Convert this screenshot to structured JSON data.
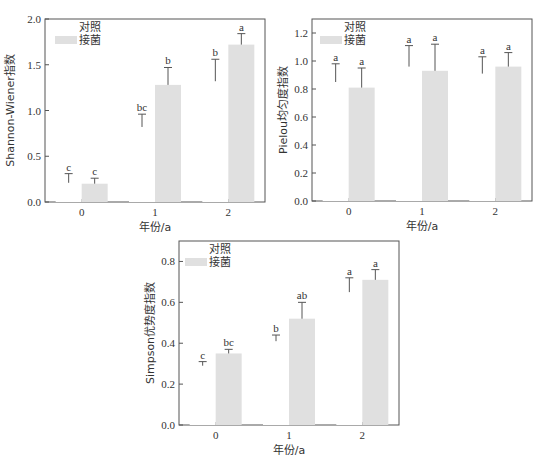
{
  "colors": {
    "treatment_bar": "#e0e0e0",
    "control_bar": "#ffffff",
    "axis": "#555555",
    "text": "#333333"
  },
  "legend": {
    "control": "对照",
    "treatment": "接菌"
  },
  "chart_data": [
    {
      "type": "bar",
      "title": "",
      "xlabel": "年份/a",
      "ylabel": "Shannon-Wiener指数",
      "ylim": [
        0,
        2.0
      ],
      "yticks": [
        0.0,
        0.5,
        1.0,
        1.5,
        2.0
      ],
      "ytick_labels": [
        "0.0",
        "0.5",
        "1.0",
        "1.5",
        "2.0"
      ],
      "categories": [
        "0",
        "1",
        "2"
      ],
      "legend_position": "upper left",
      "grid": false,
      "series": [
        {
          "name": "对照",
          "values": [
            0.21,
            0.82,
            1.32
          ],
          "error": [
            0.1,
            0.14,
            0.24
          ],
          "labels": [
            "c",
            "bc",
            "b"
          ]
        },
        {
          "name": "接菌",
          "values": [
            0.2,
            1.28,
            1.72
          ],
          "error": [
            0.06,
            0.19,
            0.12
          ],
          "labels": [
            "c",
            "b",
            "a"
          ]
        }
      ]
    },
    {
      "type": "bar",
      "title": "",
      "xlabel": "年份/a",
      "ylabel": "Pielou均匀度指数",
      "ylim": [
        0,
        1.3
      ],
      "yticks": [
        0.0,
        0.2,
        0.4,
        0.6,
        0.8,
        1.0,
        1.2
      ],
      "ytick_labels": [
        "0.0",
        "0.2",
        "0.4",
        "0.6",
        "0.8",
        "1.0",
        "1.2"
      ],
      "categories": [
        "0",
        "1",
        "2"
      ],
      "legend_position": "upper left",
      "grid": false,
      "series": [
        {
          "name": "对照",
          "values": [
            0.85,
            0.96,
            0.91
          ],
          "error": [
            0.13,
            0.15,
            0.12
          ],
          "labels": [
            "a",
            "a",
            "a"
          ]
        },
        {
          "name": "接菌",
          "values": [
            0.81,
            0.93,
            0.96
          ],
          "error": [
            0.14,
            0.19,
            0.1
          ],
          "labels": [
            "a",
            "a",
            "a"
          ]
        }
      ]
    },
    {
      "type": "bar",
      "title": "",
      "xlabel": "年份/a",
      "ylabel": "Simpson优势度指数",
      "ylim": [
        0,
        0.9
      ],
      "yticks": [
        0.0,
        0.2,
        0.4,
        0.6,
        0.8
      ],
      "ytick_labels": [
        "0.0",
        "0.2",
        "0.4",
        "0.6",
        "0.8"
      ],
      "categories": [
        "0",
        "1",
        "2"
      ],
      "legend_position": "upper left",
      "grid": false,
      "series": [
        {
          "name": "对照",
          "values": [
            0.29,
            0.41,
            0.65
          ],
          "error": [
            0.02,
            0.03,
            0.07
          ],
          "labels": [
            "c",
            "b",
            "a"
          ]
        },
        {
          "name": "接菌",
          "values": [
            0.35,
            0.52,
            0.71
          ],
          "error": [
            0.02,
            0.08,
            0.05
          ],
          "labels": [
            "bc",
            "ab",
            "a"
          ]
        }
      ]
    }
  ]
}
